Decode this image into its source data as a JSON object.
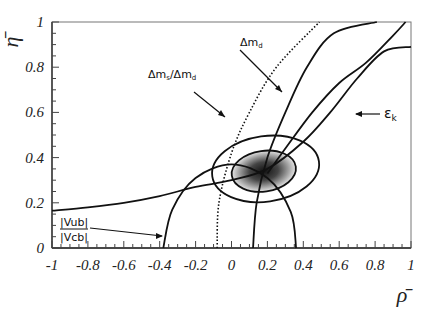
{
  "chart_data": {
    "type": "line",
    "title": "",
    "xlabel": "ρ̄",
    "ylabel": "η̄",
    "xlim": [
      -1,
      1
    ],
    "ylim": [
      0,
      1
    ],
    "grid": false,
    "x_ticks": [
      "-1",
      "-0.8",
      "-0.6",
      "-0.4",
      "-0.2",
      "0",
      "0.2",
      "0.4",
      "0.6",
      "0.8",
      "1"
    ],
    "y_ticks": [
      "0",
      "0.2",
      "0.4",
      "0.6",
      "0.8",
      "1"
    ],
    "series": [
      {
        "name": "|Vub|/|Vcb|",
        "style": "solid",
        "shape": "circle-arc",
        "center": [
          0,
          0
        ],
        "radius": 0.37,
        "points": [
          [
            -0.38,
            0.0
          ],
          [
            -0.33,
            0.17
          ],
          [
            -0.2,
            0.31
          ],
          [
            0.0,
            0.37
          ],
          [
            0.2,
            0.31
          ],
          [
            0.33,
            0.16
          ],
          [
            0.36,
            0.0
          ]
        ]
      },
      {
        "name": "Δm_d",
        "style": "solid",
        "shape": "circle-arc",
        "points": [
          [
            0.12,
            0.0
          ],
          [
            0.14,
            0.2
          ],
          [
            0.2,
            0.4
          ],
          [
            0.3,
            0.6
          ],
          [
            0.42,
            0.8
          ],
          [
            0.57,
            0.95
          ],
          [
            0.81,
            1.0
          ]
        ]
      },
      {
        "name": "Δm_s/Δm_d",
        "style": "dotted",
        "shape": "circle-arc",
        "points": [
          [
            -0.08,
            0.0
          ],
          [
            -0.07,
            0.2
          ],
          [
            0.0,
            0.42
          ],
          [
            0.1,
            0.6
          ],
          [
            0.25,
            0.8
          ],
          [
            0.49,
            1.0
          ]
        ]
      },
      {
        "name": "ε_K (lower branch)",
        "style": "solid",
        "shape": "hyperbola",
        "points": [
          [
            -1.0,
            0.165
          ],
          [
            -0.8,
            0.18
          ],
          [
            -0.6,
            0.2
          ],
          [
            -0.4,
            0.23
          ],
          [
            -0.2,
            0.27
          ],
          [
            0.0,
            0.3
          ],
          [
            0.2,
            0.35
          ],
          [
            0.4,
            0.47
          ],
          [
            0.55,
            0.6
          ],
          [
            0.7,
            0.75
          ],
          [
            0.85,
            0.87
          ],
          [
            1.0,
            0.89
          ]
        ]
      },
      {
        "name": "ε_K (upper branch)",
        "style": "solid",
        "shape": "hyperbola",
        "points": [
          [
            0.2,
            0.33
          ],
          [
            0.3,
            0.44
          ],
          [
            0.45,
            0.6
          ],
          [
            0.6,
            0.73
          ],
          [
            0.75,
            0.82
          ],
          [
            0.9,
            0.94
          ],
          [
            0.97,
            1.0
          ]
        ]
      }
    ],
    "contours": [
      {
        "name": "inner 68% region",
        "center": [
          0.18,
          0.34
        ],
        "rx": 0.18,
        "ry": 0.09,
        "fill": "shaded"
      },
      {
        "name": "outer 95% region",
        "center": [
          0.19,
          0.35
        ],
        "rx": 0.3,
        "ry": 0.145,
        "fill": "none"
      }
    ],
    "annotations": [
      {
        "text": "Δm_d",
        "label_pos": [
          0.12,
          0.78
        ],
        "arrow_to": [
          0.26,
          0.62
        ]
      },
      {
        "text": "Δm_s/Δm_d",
        "label_pos": [
          -0.44,
          0.64
        ],
        "arrow_to": [
          -0.05,
          0.53
        ]
      },
      {
        "text": "ε_K",
        "label_pos": [
          0.75,
          0.51
        ],
        "arrow_to": [
          0.52,
          0.51
        ]
      },
      {
        "text": "|Vub|/|Vcb|",
        "label_pos": [
          -0.6,
          0.12
        ],
        "arrow_to": [
          -0.37,
          0.05
        ]
      }
    ]
  },
  "labels": {
    "y_axis_title": "η̄",
    "x_axis_title": "ρ̄",
    "vub_num": "|Vub|",
    "vub_den": "|Vcb|",
    "dmd": "Δm",
    "dmd_sub": "d",
    "dms_dmd_a": "Δm",
    "dms_dmd_a_sub": "s",
    "dms_dmd_sep": "/Δm",
    "dms_dmd_b_sub": "d",
    "epsk": "ε",
    "epsk_sub": "k"
  }
}
